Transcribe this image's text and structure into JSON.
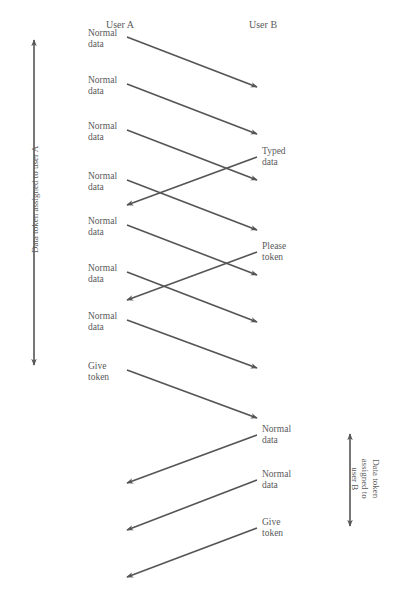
{
  "header": {
    "cut_title": "",
    "user_a": "User A",
    "user_b": "User B"
  },
  "side_labels": {
    "left": "Data token assigned to user A",
    "right": "Data token\nassigned to\nuser B"
  },
  "messages": [
    {
      "from": "A",
      "label": "Normal\ndata",
      "y_start": 37,
      "y_end": 87
    },
    {
      "from": "A",
      "label": "Normal\ndata",
      "y_start": 84,
      "y_end": 134
    },
    {
      "from": "A",
      "label": "Normal\ndata",
      "y_start": 130,
      "y_end": 180
    },
    {
      "from": "B",
      "label": "Typed\ndata",
      "y_start": 157,
      "y_end": 205
    },
    {
      "from": "A",
      "label": "Normal\ndata",
      "y_start": 180,
      "y_end": 230
    },
    {
      "from": "A",
      "label": "Normal\ndata",
      "y_start": 225,
      "y_end": 275
    },
    {
      "from": "B",
      "label": "Please\ntoken",
      "y_start": 252,
      "y_end": 300
    },
    {
      "from": "A",
      "label": "Normal\ndata",
      "y_start": 272,
      "y_end": 322
    },
    {
      "from": "A",
      "label": "Normal\ndata",
      "y_start": 320,
      "y_end": 368
    },
    {
      "from": "A",
      "label": "Give\ntoken",
      "y_start": 370,
      "y_end": 418
    },
    {
      "from": "B",
      "label": "Normal\ndata",
      "y_start": 435,
      "y_end": 483
    },
    {
      "from": "B",
      "label": "Normal\ndata",
      "y_start": 480,
      "y_end": 530
    },
    {
      "from": "B",
      "label": "Give\ntoken",
      "y_start": 528,
      "y_end": 577
    }
  ],
  "colors": {
    "line": "#555555",
    "text": "#5a5a5a"
  }
}
